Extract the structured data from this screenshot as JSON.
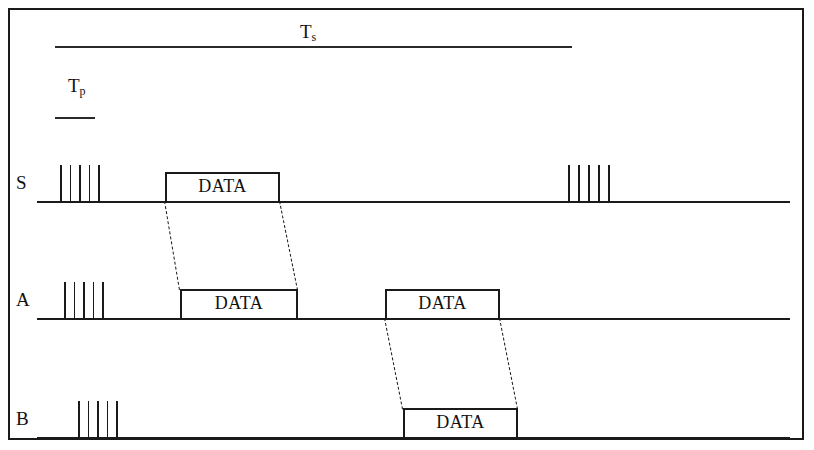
{
  "figure": {
    "title_symbols": {
      "slot_time": {
        "text": "T",
        "sub": "s",
        "name": "slot-time"
      },
      "propagation_time": {
        "text": "T",
        "sub": "p",
        "name": "propagation-time"
      }
    },
    "colors": {
      "ink": "#1a1a1a",
      "background": "#ffffff"
    },
    "rows": [
      {
        "label": "S",
        "name": "station-s",
        "baseline_y": 201,
        "baseline_x1": 37,
        "baseline_x2": 790,
        "label_x": 16,
        "label_y": 173,
        "pulse_trains": [
          {
            "name": "preamble-burst-s-1",
            "x": 60,
            "width": 38,
            "count": 5,
            "height": 36
          },
          {
            "name": "preamble-burst-s-2",
            "x": 568,
            "width": 40,
            "count": 5,
            "height": 36
          }
        ],
        "packets": [
          {
            "label": "DATA",
            "name": "data-packet-s-1",
            "x1": 165,
            "x2": 280,
            "height": 29
          }
        ]
      },
      {
        "label": "A",
        "name": "station-a",
        "baseline_y": 318,
        "baseline_x1": 37,
        "baseline_x2": 790,
        "label_x": 16,
        "label_y": 290,
        "pulse_trains": [
          {
            "name": "preamble-burst-a-1",
            "x": 64,
            "width": 38,
            "count": 5,
            "height": 36
          }
        ],
        "packets": [
          {
            "label": "DATA",
            "name": "data-packet-a-1",
            "x1": 180,
            "x2": 298,
            "height": 29
          },
          {
            "label": "DATA",
            "name": "data-packet-a-2",
            "x1": 385,
            "x2": 500,
            "height": 29
          }
        ]
      },
      {
        "label": "B",
        "name": "station-b",
        "baseline_y": 437,
        "baseline_x1": 37,
        "baseline_x2": 790,
        "label_x": 16,
        "label_y": 409,
        "pulse_trains": [
          {
            "name": "preamble-burst-b-1",
            "x": 78,
            "width": 38,
            "count": 5,
            "height": 36
          }
        ],
        "packets": [
          {
            "label": "DATA",
            "name": "data-packet-b-1",
            "x1": 403,
            "x2": 518,
            "height": 29
          }
        ]
      }
    ],
    "measure_bars": [
      {
        "name": "slot-time-bar",
        "x1": 55,
        "x2": 572,
        "y": 46
      },
      {
        "name": "propagation-time-bar",
        "x1": 55,
        "x2": 95,
        "y": 117
      }
    ],
    "measure_labels": [
      {
        "name": "slot-time-label",
        "x": 300,
        "y": 22,
        "symbol": "T",
        "sub": "s"
      },
      {
        "name": "propagation-time-label",
        "x": 68,
        "y": 76,
        "symbol": "T",
        "sub": "p"
      }
    ],
    "propagation_links": [
      {
        "name": "prop-link-s-to-a-left",
        "x1": 165,
        "y1": 201,
        "x2": 180,
        "y2": 290
      },
      {
        "name": "prop-link-s-to-a-right",
        "x1": 280,
        "y1": 201,
        "x2": 298,
        "y2": 290
      },
      {
        "name": "prop-link-a-to-b-left",
        "x1": 385,
        "y1": 318,
        "x2": 403,
        "y2": 409
      },
      {
        "name": "prop-link-a-to-b-right",
        "x1": 500,
        "y1": 318,
        "x2": 518,
        "y2": 409
      }
    ]
  }
}
